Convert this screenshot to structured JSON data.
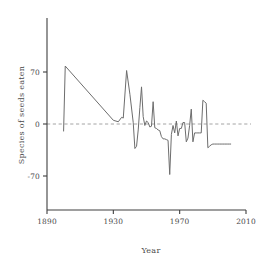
{
  "chart_data": {
    "type": "line",
    "title": "",
    "xlabel": "Year",
    "ylabel": "Species of seeds eaten",
    "xlim": [
      1890,
      2010
    ],
    "ylim": [
      -105,
      115
    ],
    "xticks": [
      1890,
      1930,
      1970,
      2010
    ],
    "xticklabels": [
      "1890",
      "1930",
      "1970",
      "2010"
    ],
    "yticks": [
      70,
      0,
      -70
    ],
    "yticklabels": [
      "70",
      "0",
      "-70"
    ],
    "grid": false,
    "legend": null,
    "reference_lines": [
      {
        "axis": "y",
        "value": 0,
        "style": "dashed",
        "color": "#9a9a9a"
      }
    ],
    "line_color": "#6d6d6d",
    "series": [
      {
        "name": "Species of seeds eaten",
        "x": [
          1900,
          1901,
          1930,
          1933,
          1935,
          1936,
          1938,
          1940,
          1942,
          1943,
          1944,
          1945,
          1946,
          1947,
          1948,
          1949,
          1950,
          1951,
          1952,
          1953,
          1954,
          1955,
          1956,
          1957,
          1958,
          1959,
          1960,
          1961,
          1962,
          1963,
          1964,
          1965,
          1966,
          1967,
          1968,
          1969,
          1970,
          1971,
          1972,
          1973,
          1974,
          1975,
          1976,
          1977,
          1978,
          1979,
          1980,
          1981,
          1982,
          1983,
          1984,
          1985,
          1986,
          1987,
          1988,
          1989,
          1990,
          1991,
          1992,
          1993,
          1994,
          1995,
          1996,
          1997,
          1998,
          1999,
          2000,
          2001
        ],
        "y": [
          -10,
          78,
          5,
          3,
          9,
          8,
          72,
          40,
          2,
          -33,
          -30,
          -8,
          22,
          50,
          10,
          -2,
          4,
          2,
          -4,
          -3,
          30,
          -5,
          -6,
          -8,
          -9,
          -17,
          -20,
          -20,
          -21,
          -22,
          -68,
          -14,
          -2,
          -12,
          4,
          -16,
          -6,
          -6,
          2,
          2,
          -24,
          -19,
          -2,
          20,
          -24,
          -12,
          -12,
          -12,
          -12,
          -12,
          32,
          30,
          28,
          -32,
          -30,
          -28,
          -27,
          -27,
          -27,
          -27,
          -27,
          -27,
          -27,
          -27,
          -27,
          -27,
          -27,
          -27
        ]
      }
    ]
  }
}
